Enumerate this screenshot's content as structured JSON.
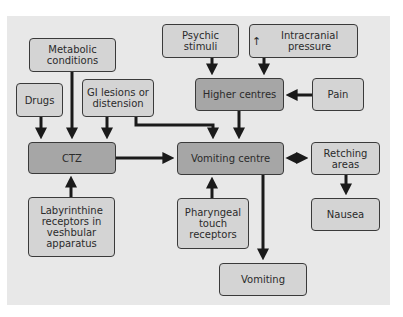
{
  "diagram": {
    "title": "",
    "nodes": {
      "metabolic": "Metabolic conditions",
      "drugs": "Drugs",
      "gi": "GI lesions or distension",
      "ctz": "CTZ",
      "labyrinthine": "Labyrinthine receptors in veshbular apparatus",
      "psychic": "Psychic stimuli",
      "intracranial_arrow": "↑",
      "intracranial": "Intracranial pressure",
      "higher": "Higher centres",
      "pain": "Pain",
      "vomiting_centre": "Vomiting centre",
      "retching": "Retching areas",
      "pharyngeal": "Pharyngeal touch receptors",
      "nausea": "Nausea",
      "vomiting": "Vomiting"
    },
    "edges": [
      {
        "from": "Metabolic conditions",
        "to": "CTZ"
      },
      {
        "from": "Drugs",
        "to": "CTZ"
      },
      {
        "from": "GI lesions or distension",
        "to": "CTZ"
      },
      {
        "from": "GI lesions or distension",
        "to": "Vomiting centre"
      },
      {
        "from": "Labyrinthine receptors in veshbular apparatus",
        "to": "CTZ"
      },
      {
        "from": "CTZ",
        "to": "Vomiting centre"
      },
      {
        "from": "Psychic stimuli",
        "to": "Higher centres"
      },
      {
        "from": "Intracranial pressure",
        "to": "Higher centres"
      },
      {
        "from": "Pain",
        "to": "Higher centres"
      },
      {
        "from": "Higher centres",
        "to": "Vomiting centre"
      },
      {
        "from": "Pharyngeal touch receptors",
        "to": "Vomiting centre"
      },
      {
        "from": "Vomiting centre",
        "to": "Retching areas",
        "bidirectional": true
      },
      {
        "from": "Retching areas",
        "to": "Nausea"
      },
      {
        "from": "Vomiting centre",
        "to": "Vomiting"
      }
    ],
    "colors": {
      "panel": "#e8e8e8",
      "box_light": "#d4d4d4",
      "box_dark": "#a6a6a6",
      "stroke": "#1a1a1a"
    }
  }
}
